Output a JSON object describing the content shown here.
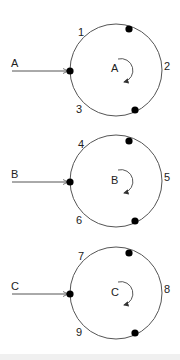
{
  "diagram": {
    "units": [
      {
        "id": "A",
        "input_label": "A",
        "center_label": "A",
        "arc_labels": [
          "1",
          "2",
          "3"
        ],
        "cy": 70
      },
      {
        "id": "B",
        "input_label": "B",
        "center_label": "B",
        "arc_labels": [
          "4",
          "5",
          "6"
        ],
        "cy": 181
      },
      {
        "id": "C",
        "input_label": "C",
        "center_label": "C",
        "arc_labels": [
          "7",
          "8",
          "9"
        ],
        "cy": 293
      }
    ],
    "colors": {
      "line": "#555555",
      "node": "#000000",
      "text": "#222222"
    }
  }
}
